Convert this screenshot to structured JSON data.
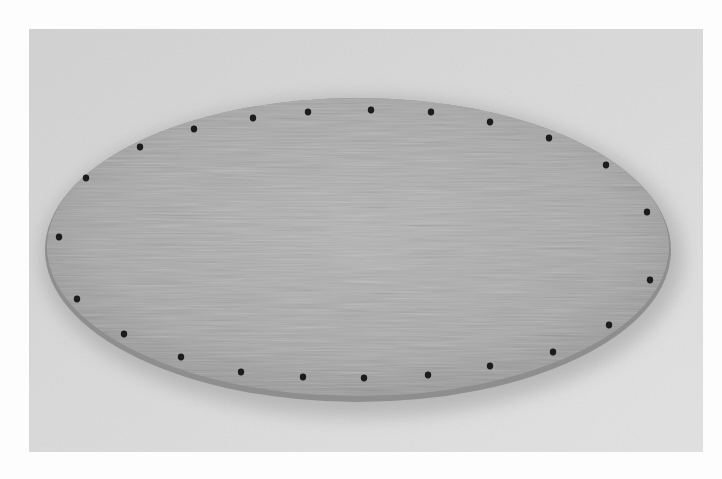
{
  "image": {
    "description": "Grayscale photograph of an oval wooden basket base with drilled holes around its perimeter",
    "subject": "oval-wooden-base",
    "hole_count": 24,
    "colors": {
      "page_background": "#fdfdfd",
      "backdrop": "#d9d9d9",
      "board": "#a9a9a9",
      "board_edge": "#8c8c8c",
      "shadow": "#b8b8b8",
      "hole": "#1e1e1e"
    },
    "board": {
      "cx": 358,
      "cy": 247,
      "rx": 313,
      "ry": 152
    },
    "holes": [
      [
        59,
        237
      ],
      [
        86,
        178
      ],
      [
        140,
        147
      ],
      [
        194,
        129
      ],
      [
        253,
        118
      ],
      [
        308,
        112
      ],
      [
        371,
        110
      ],
      [
        431,
        112
      ],
      [
        490,
        122
      ],
      [
        549,
        138
      ],
      [
        606,
        165
      ],
      [
        647,
        212
      ],
      [
        650,
        280
      ],
      [
        609,
        325
      ],
      [
        553,
        352
      ],
      [
        490,
        366
      ],
      [
        428,
        375
      ],
      [
        364,
        378
      ],
      [
        303,
        377
      ],
      [
        241,
        372
      ],
      [
        181,
        357
      ],
      [
        124,
        334
      ],
      [
        77,
        299
      ]
    ]
  }
}
